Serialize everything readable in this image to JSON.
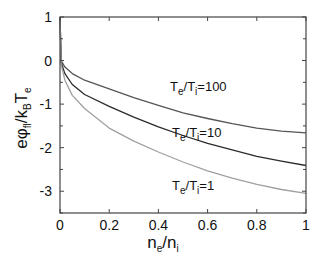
{
  "chart_data": {
    "type": "line",
    "title": "",
    "xlabel": "n_e/n_i",
    "ylabel": "eφ_fl/k_B T_e",
    "xlim": [
      0,
      1
    ],
    "ylim": [
      -3.5,
      1
    ],
    "grid": false,
    "legend": "inline annotations",
    "x_ticks": [
      0,
      0.2,
      0.4,
      0.6,
      0.8,
      1
    ],
    "x_tick_labels": [
      "0",
      "0.2",
      "0.4",
      "0.6",
      "0.8",
      "1"
    ],
    "y_ticks": [
      1,
      0,
      -1,
      -2,
      -3
    ],
    "y_tick_labels": [
      "1",
      "0",
      "-1",
      "-2",
      "-3"
    ],
    "x": [
      0,
      0.005,
      0.02,
      0.05,
      0.1,
      0.2,
      0.3,
      0.4,
      0.5,
      0.6,
      0.7,
      0.8,
      0.9,
      1.0
    ],
    "series": [
      {
        "name": "T_e/T_i=100",
        "color": "#555555",
        "values": [
          1.0,
          0.0,
          -0.15,
          -0.3,
          -0.45,
          -0.65,
          -0.85,
          -1.03,
          -1.2,
          -1.33,
          -1.45,
          -1.55,
          -1.62,
          -1.66
        ]
      },
      {
        "name": "T_e/T_i=10",
        "color": "#2a2a2a",
        "values": [
          1.0,
          -0.05,
          -0.3,
          -0.55,
          -0.78,
          -1.05,
          -1.3,
          -1.52,
          -1.72,
          -1.9,
          -2.05,
          -2.2,
          -2.31,
          -2.41
        ]
      },
      {
        "name": "T_e/T_i=1",
        "color": "#a0a0a0",
        "values": [
          1.0,
          -0.1,
          -0.45,
          -0.8,
          -1.1,
          -1.55,
          -1.85,
          -2.1,
          -2.33,
          -2.53,
          -2.7,
          -2.84,
          -2.96,
          -3.05
        ]
      }
    ],
    "annotations": [
      {
        "main": "T",
        "sub1": "e",
        "mid": "/T",
        "sub2": "i",
        "tail": "=100",
        "x_px": 170,
        "y_px": 91
      },
      {
        "main": "T",
        "sub1": "e",
        "mid": "/T",
        "sub2": "i",
        "tail": "=10",
        "x_px": 172,
        "y_px": 137
      },
      {
        "main": "T",
        "sub1": "e",
        "mid": "/T",
        "sub2": "i",
        "tail": "=1",
        "x_px": 172,
        "y_px": 190
      }
    ]
  },
  "axes": {
    "ylabel_parts": {
      "e_phi": "eφ",
      "sub_fl": "fl",
      "slash_k": "/k",
      "sub_B": "B",
      "T": "T",
      "sub_e": "e"
    },
    "xlabel_parts": {
      "n1": "n",
      "sub_e": "e",
      "slash_n": "/n",
      "sub_i": "i"
    }
  }
}
